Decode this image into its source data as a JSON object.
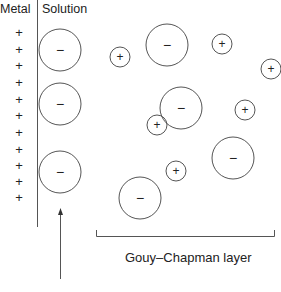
{
  "labels": {
    "metal": "Metal",
    "solution": "Solution",
    "gouy_chapman": "Gouy–Chapman layer"
  },
  "metal_charges": {
    "symbol": "+",
    "y_positions": [
      33,
      50,
      66,
      83,
      100,
      116,
      133,
      150,
      166,
      182,
      198
    ]
  },
  "ions": {
    "anion_symbol": "−",
    "cation_symbol": "+",
    "anions": [
      {
        "cx": 60,
        "cy": 50,
        "r": 21
      },
      {
        "cx": 60,
        "cy": 104,
        "r": 21
      },
      {
        "cx": 60,
        "cy": 172,
        "r": 21
      },
      {
        "cx": 167,
        "cy": 45,
        "r": 21
      },
      {
        "cx": 181,
        "cy": 108,
        "r": 21
      },
      {
        "cx": 233,
        "cy": 158,
        "r": 21
      },
      {
        "cx": 140,
        "cy": 198,
        "r": 21
      }
    ],
    "cations": [
      {
        "cx": 120,
        "cy": 57,
        "r": 10
      },
      {
        "cx": 222,
        "cy": 44,
        "r": 10
      },
      {
        "cx": 271,
        "cy": 69,
        "r": 10
      },
      {
        "cx": 157,
        "cy": 125,
        "r": 10
      },
      {
        "cx": 245,
        "cy": 110,
        "r": 10
      },
      {
        "cx": 176,
        "cy": 171,
        "r": 10
      }
    ]
  },
  "colors": {
    "line": "#555555",
    "text": "#222222"
  }
}
